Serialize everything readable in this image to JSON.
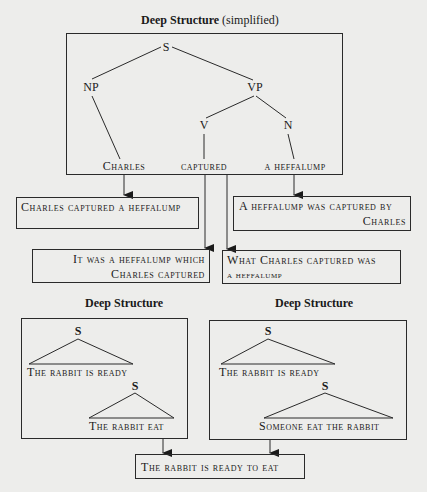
{
  "top_diagram": {
    "title_bold": "Deep Structure",
    "title_light": "(simplified)",
    "nodes": {
      "s": "S",
      "np": "NP",
      "vp": "VP",
      "v": "V",
      "n": "N"
    },
    "leaves": {
      "np": "Charles",
      "v": "captured",
      "n": "a heffalump"
    }
  },
  "surface_sentences": {
    "active": "Charles captured a heffalump",
    "passive_line1": "A heffalump was captured by",
    "passive_line2": "Charles",
    "cleft_line1": "It was a heffalump which",
    "cleft_line2": "Charles captured",
    "pseudo_cleft_line1": "What Charles captured was",
    "pseudo_cleft_line2": "a heffalump"
  },
  "lower_left": {
    "title": "Deep Structure",
    "s_top": "S",
    "clause_top": "The rabbit is ready",
    "s_embedded": "S",
    "clause_embedded": "The rabbit eat"
  },
  "lower_right": {
    "title": "Deep Structure",
    "s_top": "S",
    "clause_top": "The rabbit is ready",
    "s_embedded": "S",
    "clause_embedded": "Someone eat the rabbit"
  },
  "ambiguous_surface": "The rabbit is ready to eat"
}
